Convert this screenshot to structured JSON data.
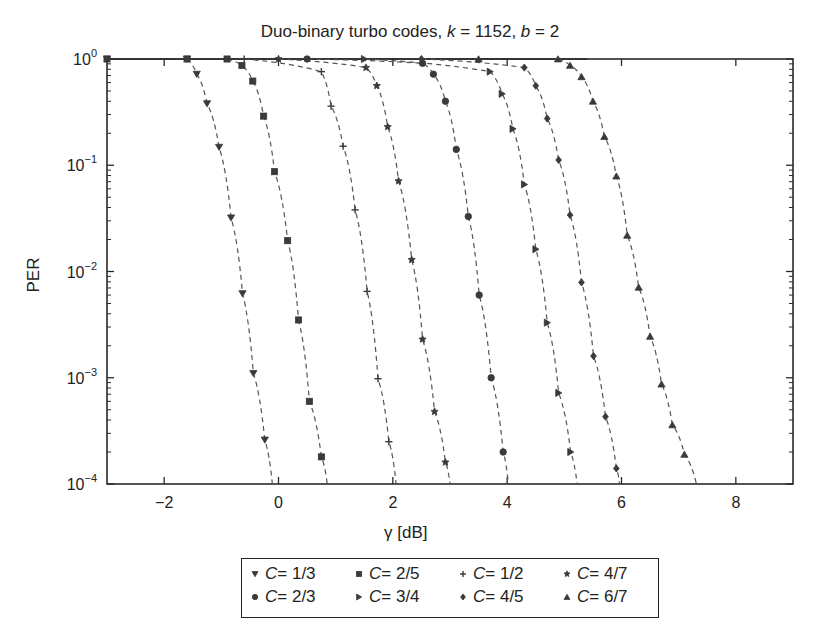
{
  "chart_data": {
    "type": "line",
    "title_prefix": "Duo-binary turbo codes, ",
    "title_k_var": "k",
    "title_k_eq": " = 1152, ",
    "title_b_var": "b",
    "title_b_eq": " = 2",
    "title": "Duo-binary turbo codes, k = 1152, b = 2",
    "xlabel": "γ [dB]",
    "ylabel": "PER",
    "xlim": [
      -3,
      9
    ],
    "ylim": [
      0.0001,
      1
    ],
    "yscale": "log",
    "grid": false,
    "legend_position": "below",
    "x_ticks": [
      -2,
      0,
      2,
      4,
      6,
      8
    ],
    "x_tick_labels": [
      "−2",
      "0",
      "2",
      "4",
      "6",
      "8"
    ],
    "y_ticks": [
      1,
      0.1,
      0.01,
      0.001,
      0.0001
    ],
    "y_tick_exponents": [
      "0",
      "−1",
      "−2",
      "−3",
      "−4"
    ],
    "series": [
      {
        "name": "C = 1/3",
        "rate": "1/3",
        "marker": "triangle-down",
        "x": [
          -3.0,
          -1.6,
          -1.43,
          -1.25,
          -1.04,
          -0.83,
          -0.63,
          -0.44,
          -0.24
        ],
        "y": [
          1.0,
          1.0,
          0.72,
          0.38,
          0.148,
          0.032,
          0.0062,
          0.0011,
          0.00026
        ]
      },
      {
        "name": "C = 2/5",
        "rate": "2/5",
        "marker": "square",
        "x": [
          -3.0,
          -1.6,
          -0.9,
          -0.64,
          -0.45,
          -0.26,
          -0.07,
          0.16,
          0.35,
          0.54,
          0.75
        ],
        "y": [
          1.0,
          1.0,
          1.0,
          0.87,
          0.62,
          0.29,
          0.087,
          0.0195,
          0.0035,
          0.0006,
          0.00018
        ]
      },
      {
        "name": "C = 1/2",
        "rate": "1/2",
        "marker": "plus",
        "x": [
          -0.6,
          0.75,
          0.92,
          1.13,
          1.34,
          1.55,
          1.74,
          1.93
        ],
        "y": [
          1.0,
          0.76,
          0.36,
          0.151,
          0.038,
          0.0065,
          0.00098,
          0.00025
        ]
      },
      {
        "name": "C = 4/7",
        "rate": "4/7",
        "marker": "star",
        "x": [
          0.0,
          1.53,
          1.72,
          1.91,
          2.1,
          2.33,
          2.52,
          2.73,
          2.92
        ],
        "y": [
          1.0,
          0.83,
          0.56,
          0.23,
          0.071,
          0.0129,
          0.0023,
          0.00048,
          0.00016
        ]
      },
      {
        "name": "C = 2/3",
        "rate": "2/3",
        "marker": "circle",
        "x": [
          0.5,
          2.52,
          2.71,
          2.92,
          3.11,
          3.32,
          3.51,
          3.72,
          3.93
        ],
        "y": [
          1.0,
          0.91,
          0.72,
          0.4,
          0.141,
          0.033,
          0.006,
          0.001,
          0.0002
        ]
      },
      {
        "name": "C = 3/4",
        "rate": "3/4",
        "marker": "triangle-right",
        "x": [
          1.5,
          3.7,
          3.91,
          4.1,
          4.3,
          4.5,
          4.7,
          4.9,
          5.11
        ],
        "y": [
          1.0,
          0.76,
          0.47,
          0.22,
          0.066,
          0.0162,
          0.0033,
          0.00072,
          0.0002
        ]
      },
      {
        "name": "C = 4/5",
        "rate": "4/5",
        "marker": "diamond",
        "x": [
          2.5,
          4.3,
          4.5,
          4.7,
          4.9,
          5.1,
          5.3,
          5.51,
          5.72,
          5.91
        ],
        "y": [
          1.0,
          0.83,
          0.56,
          0.275,
          0.112,
          0.034,
          0.0079,
          0.0016,
          0.00043,
          0.00014
        ]
      },
      {
        "name": "C = 6/7",
        "rate": "6/7",
        "marker": "triangle-up",
        "x": [
          3.5,
          4.89,
          5.1,
          5.3,
          5.5,
          5.7,
          5.91,
          6.1,
          6.3,
          6.5,
          6.7,
          6.89,
          7.1
        ],
        "y": [
          1.0,
          1.0,
          0.87,
          0.68,
          0.4,
          0.186,
          0.079,
          0.0219,
          0.0071,
          0.00245,
          0.00087,
          0.00036,
          0.00019
        ]
      }
    ]
  },
  "legend": {
    "items": [
      {
        "var": "C",
        "eq": " = 1/3",
        "marker": "triangle-down"
      },
      {
        "var": "C",
        "eq": " = 2/5",
        "marker": "square"
      },
      {
        "var": "C",
        "eq": " = 1/2",
        "marker": "plus"
      },
      {
        "var": "C",
        "eq": " = 4/7",
        "marker": "star"
      },
      {
        "var": "C",
        "eq": " = 2/3",
        "marker": "circle"
      },
      {
        "var": "C",
        "eq": " = 3/4",
        "marker": "triangle-right"
      },
      {
        "var": "C",
        "eq": " = 4/5",
        "marker": "diamond"
      },
      {
        "var": "C",
        "eq": " = 6/7",
        "marker": "triangle-up"
      }
    ]
  },
  "colors": {
    "ink": "#2a2a2a",
    "marker": "#3a3a3a",
    "background": "#ffffff"
  }
}
